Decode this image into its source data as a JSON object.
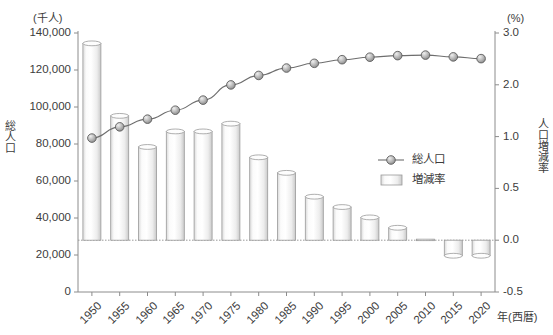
{
  "chart_data": {
    "type": "bar",
    "title": "",
    "subtitle": "",
    "xlabel": "年(西暦)",
    "ylabel": "総人口",
    "y2label": "人口増減率",
    "left_unit": "(千人)",
    "right_unit": "(%)",
    "grid": false,
    "legend_position": "middle-right",
    "categories": [
      "1950",
      "1955",
      "1960",
      "1965",
      "1970",
      "1975",
      "1980",
      "1985",
      "1990",
      "1995",
      "2000",
      "2005",
      "2010",
      "2015",
      "2020"
    ],
    "left_axis": {
      "min": 0,
      "max": 140000,
      "ticks": [
        0,
        20000,
        40000,
        60000,
        80000,
        100000,
        120000,
        140000
      ],
      "tick_labels": [
        "0",
        "20,000",
        "40,000",
        "60,000",
        "80,000",
        "100,000",
        "120,000",
        "140,000"
      ]
    },
    "right_axis": {
      "min": -0.5,
      "max": 3.0,
      "ticks": [
        -0.5,
        0.0,
        0.5,
        1.0,
        2.0,
        3.0
      ],
      "tick_labels": [
        "-0.5",
        "0.0",
        "0.5",
        "1.0",
        "2.0",
        "3.0"
      ]
    },
    "series": [
      {
        "name": "総人口",
        "type": "line",
        "axis": "left",
        "unit": "千人",
        "values": [
          83200,
          89276,
          93419,
          98275,
          103720,
          111940,
          117060,
          121049,
          123611,
          125570,
          126926,
          127768,
          128057,
          127095,
          126146
        ]
      },
      {
        "name": "増減率",
        "type": "bar",
        "axis": "right",
        "unit": "%",
        "values": [
          2.8,
          1.4,
          0.9,
          1.1,
          1.1,
          1.25,
          0.8,
          0.65,
          0.42,
          0.32,
          0.22,
          0.12,
          0.01,
          -0.15,
          -0.15
        ]
      }
    ]
  },
  "legend": {
    "items": [
      {
        "label": "総人口",
        "marker": "line-with-circle"
      },
      {
        "label": "増減率",
        "marker": "bar-swatch"
      }
    ]
  },
  "colors": {
    "axis": "#8c8c8c",
    "line": "#6e6e6e",
    "marker_fill": "#b0b0b0",
    "marker_stroke": "#5e5e5e",
    "bar_fill": "#f4f4f4",
    "bar_stroke": "#9a9a9a",
    "text": "#3c3c3c",
    "zero_line": "#9a9a9a"
  }
}
